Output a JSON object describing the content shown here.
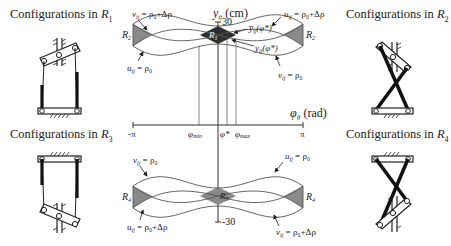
{
  "captions": {
    "r1": {
      "prefix": "Configurations in ",
      "region": "R",
      "sub": "1"
    },
    "r2": {
      "prefix": "Configurations in ",
      "region": "R",
      "sub": "2"
    },
    "r3": {
      "prefix": "Configurations in ",
      "region": "R",
      "sub": "3"
    },
    "r4": {
      "prefix": "Configurations in ",
      "region": "R",
      "sub": "4"
    }
  },
  "axes": {
    "y_label": "y",
    "y_label_sub": "ij",
    "y_unit": " (cm)",
    "y_top_tick": "30",
    "y_bottom_tick": "-30",
    "x_label": "φ",
    "x_label_sub": "ij",
    "x_unit": " (rad)",
    "x_ticks": {
      "neg_pi": "-π",
      "phi_min": "φ",
      "phi_min_sub": "min",
      "phi_star": "φ*",
      "phi_max": "φ",
      "phi_max_sub": "max",
      "pi": "π"
    }
  },
  "top_plot": {
    "region_left": "R",
    "region_left_sub": "2",
    "region_right": "R",
    "region_right_sub": "2",
    "region_center": "R",
    "region_center_sub": "1",
    "ann_top_left": "v",
    "ann_top_left_sub": "ij",
    "ann_top_left_eq": " = ρ₀+Δρ",
    "ann_bottom_left": "u",
    "ann_bottom_left_sub": "ij",
    "ann_bottom_left_eq": " = ρ₀",
    "ann_top_right": "u",
    "ann_top_right_sub": "ij",
    "ann_top_right_eq": " = ρ₀+Δρ",
    "ann_bottom_right": "v",
    "ann_bottom_right_sub": "ij",
    "ann_bottom_right_eq": " = ρ₀",
    "ann_upper_bound": "y̅",
    "ann_upper_bound_sub": "ij",
    "ann_upper_bound_arg": "(φ*)",
    "ann_lower_bound": "y",
    "ann_lower_bound_sub": "ij",
    "ann_lower_bound_arg": "(φ*)"
  },
  "bottom_plot": {
    "region_left": "R",
    "region_left_sub": "4",
    "region_right": "R",
    "region_right_sub": "4",
    "region_center": "R",
    "region_center_sub": "3",
    "ann_top_left": "v",
    "ann_top_left_sub": "ij",
    "ann_top_left_eq": " = ρ₀",
    "ann_bottom_left": "u",
    "ann_bottom_left_sub": "ij",
    "ann_bottom_left_eq": " = ρ₀+Δρ",
    "ann_top_right": "u",
    "ann_top_right_sub": "ij",
    "ann_top_right_eq": " = ρ₀",
    "ann_bottom_right": "v",
    "ann_bottom_right_sub": "ij",
    "ann_bottom_right_eq": " = ρ₀+Δρ"
  },
  "colors": {
    "line": "#555555",
    "dark_fill": "#333333",
    "mid_fill": "#8a8a8a",
    "leg": "#1a1a1a"
  }
}
